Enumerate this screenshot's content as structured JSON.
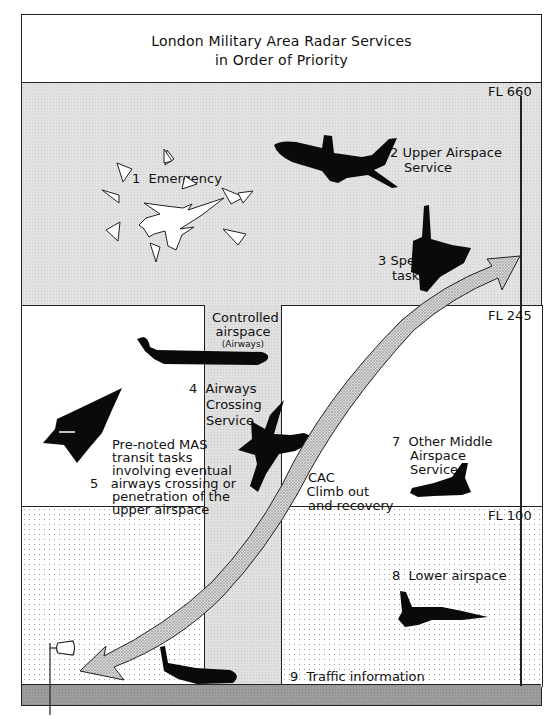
{
  "title": {
    "line1": "London Military Area Radar Services",
    "line2": "in Order of Priority"
  },
  "flight_levels": {
    "fl660": "FL 660",
    "fl245": "FL 245",
    "fl100": "FL 100"
  },
  "corridor": {
    "line1": "Controlled",
    "line2": "airspace",
    "line3": "(Airways)"
  },
  "services": [
    {
      "number": "1",
      "line1": "Emergency"
    },
    {
      "number": "2",
      "line1": "Upper Airspace",
      "line2": "Service"
    },
    {
      "number": "3",
      "line1": "Special",
      "line2": "tasks"
    },
    {
      "number": "4",
      "line1": "Airways",
      "line2": "Crossing",
      "line3": "Service"
    },
    {
      "number": "5",
      "line1": "Pre-noted MAS",
      "line2": "transit tasks",
      "line3": "involving eventual",
      "line4": "airways crossing or",
      "line5": "penetration of the",
      "line6": "upper airspace"
    },
    {
      "number": "6",
      "line0": "CAC",
      "line1": "Climb out",
      "line2": "and recovery"
    },
    {
      "number": "7",
      "line1": "Other Middle",
      "line2": "Airspace",
      "line3": "Services"
    },
    {
      "number": "8",
      "line1": "Lower airspace"
    },
    {
      "number": "9",
      "line1": "Traffic information"
    }
  ],
  "colors": {
    "line": "#222222",
    "upper_fill": "#e2e2e2",
    "ground_fill": "#9c9c9c",
    "silhouette": "#0a0a0a"
  }
}
